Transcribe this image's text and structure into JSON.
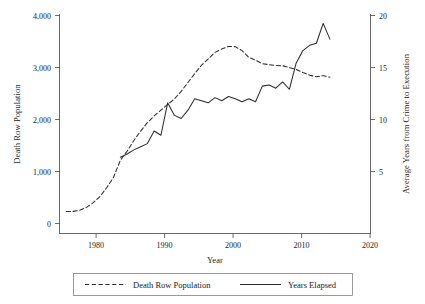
{
  "chart_data": {
    "type": "line",
    "title": "",
    "xlabel": "Year",
    "ylabel": "Death Row Population",
    "y2label": "Average Years from Crime to Execution",
    "xlim": [
      1975,
      2021
    ],
    "ylim": [
      0,
      4200
    ],
    "y2lim": [
      0,
      21
    ],
    "grid": false,
    "legend_position": "bottom",
    "xticks": [
      1980,
      1990,
      2000,
      2010,
      2020
    ],
    "xtick_labels": [
      "1980",
      "1990",
      "2000",
      "2010",
      "2020"
    ],
    "yticks": [
      0,
      1000,
      2000,
      3000,
      4000
    ],
    "ytick_labels": [
      "0",
      "1,000",
      "2,000",
      "3,000",
      "4,000"
    ],
    "y2ticks": [
      5,
      10,
      15,
      20
    ],
    "y2tick_labels": [
      "5",
      "10",
      "15",
      "20"
    ],
    "series": [
      {
        "name": "Death Row Population",
        "axis": "left",
        "style": "dashed",
        "x": [
          1976,
          1977,
          1978,
          1979,
          1980,
          1981,
          1982,
          1983,
          1984,
          1985,
          1986,
          1987,
          1988,
          1989,
          1990,
          1991,
          1992,
          1993,
          1994,
          1995,
          1996,
          1997,
          1998,
          1999,
          2000,
          2001,
          2002,
          2003,
          2004,
          2005,
          2006,
          2007,
          2008,
          2009,
          2010,
          2011,
          2012,
          2013,
          2014,
          2015
        ],
        "values": [
          420,
          423,
          445,
          500,
          590,
          710,
          880,
          1080,
          1400,
          1575,
          1780,
          1960,
          2120,
          2250,
          2360,
          2470,
          2575,
          2720,
          2890,
          3060,
          3220,
          3340,
          3465,
          3530,
          3580,
          3575,
          3500,
          3370,
          3315,
          3250,
          3230,
          3215,
          3210,
          3175,
          3140,
          3080,
          3030,
          3000,
          3020,
          2990
        ]
      },
      {
        "name": "Years Elapsed",
        "axis": "right",
        "style": "solid",
        "x": [
          1984,
          1985,
          1986,
          1987,
          1988,
          1989,
          1990,
          1991,
          1992,
          1993,
          1994,
          1995,
          1996,
          1997,
          1998,
          1999,
          2000,
          2001,
          2002,
          2003,
          2004,
          2005,
          2006,
          2007,
          2008,
          2009,
          2010,
          2011,
          2012,
          2013,
          2014,
          2015
        ],
        "values": [
          7.3,
          7.6,
          8.0,
          8.3,
          8.6,
          9.8,
          9.4,
          12.5,
          11.3,
          11.0,
          11.8,
          12.9,
          12.7,
          12.5,
          13.0,
          12.7,
          13.1,
          12.9,
          12.6,
          12.9,
          12.6,
          14.1,
          14.2,
          13.9,
          14.5,
          13.8,
          16.3,
          17.5,
          18.0,
          18.2,
          20.1,
          18.6
        ]
      }
    ]
  },
  "legend": {
    "items": [
      {
        "label": "Death Row Population",
        "style": "dashed"
      },
      {
        "label": "Years Elapsed",
        "style": "solid"
      }
    ]
  }
}
